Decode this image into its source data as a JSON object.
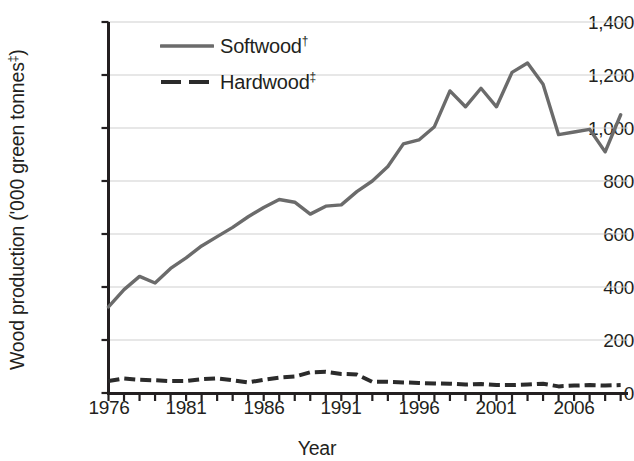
{
  "chart_data": {
    "type": "line",
    "title": "",
    "xlabel": "Year",
    "ylabel": "Wood production ('000 green tonnes‡)",
    "ylabel_main": "Wood production ('000 green tonnes",
    "ylabel_sup": "‡",
    "ylabel_tail": ")",
    "xlim": [
      1976,
      2009
    ],
    "ylim": [
      0,
      1400
    ],
    "grid": true,
    "grid_axis": "y",
    "legend_position": "top-left-inside",
    "ytick_labels": [
      "1,400",
      "1,200",
      "1,000",
      "800",
      "600",
      "400",
      "200",
      "0"
    ],
    "ytick_values": [
      1400,
      1200,
      1000,
      800,
      600,
      400,
      200,
      0
    ],
    "xtick_labels": [
      "1976",
      "1981",
      "1986",
      "1991",
      "1996",
      "2001",
      "2006"
    ],
    "xtick_values": [
      1976,
      1981,
      1986,
      1991,
      1996,
      2001,
      2006
    ],
    "x": [
      1976,
      1977,
      1978,
      1979,
      1980,
      1981,
      1982,
      1983,
      1984,
      1985,
      1986,
      1987,
      1988,
      1989,
      1990,
      1991,
      1992,
      1993,
      1994,
      1995,
      1996,
      1997,
      1998,
      1999,
      2000,
      2001,
      2002,
      2003,
      2004,
      2005,
      2006,
      2007,
      2008,
      2009
    ],
    "series": [
      {
        "name": "Softwood†",
        "name_main": "Softwood",
        "name_sup": "†",
        "style": "solid",
        "color": "#6b6b6b",
        "values": [
          325,
          390,
          440,
          415,
          470,
          510,
          555,
          590,
          625,
          665,
          700,
          730,
          720,
          675,
          705,
          710,
          760,
          800,
          855,
          940,
          955,
          1005,
          1140,
          1080,
          1150,
          1080,
          1210,
          1245,
          1165,
          975,
          985,
          995,
          910,
          1050
        ]
      },
      {
        "name": "Hardwood‡",
        "name_main": "Hardwood",
        "name_sup": "‡",
        "style": "dashed",
        "color": "#2b2b2b",
        "values": [
          45,
          55,
          50,
          48,
          45,
          45,
          52,
          55,
          48,
          40,
          50,
          58,
          62,
          78,
          80,
          72,
          70,
          42,
          42,
          40,
          38,
          36,
          35,
          32,
          34,
          30,
          30,
          32,
          35,
          25,
          28,
          30,
          28,
          30
        ]
      }
    ]
  },
  "legend": {
    "items": [
      {
        "label_main": "Softwood",
        "label_sup": "†"
      },
      {
        "label_main": "Hardwood",
        "label_sup": "‡"
      }
    ]
  },
  "axis_titles": {
    "x": "Year"
  },
  "colors": {
    "softwood": "#6b6b6b",
    "hardwood": "#2b2b2b",
    "axis": "#231f20",
    "grid": "#cfcfcf",
    "background": "#ffffff"
  }
}
